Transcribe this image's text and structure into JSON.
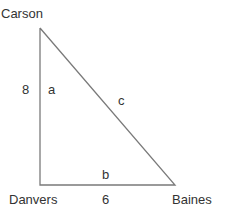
{
  "diagram": {
    "type": "right-triangle",
    "stroke_color": "#7a7a7a",
    "text_color": "#333333",
    "vertices": [
      {
        "name": "Carson",
        "x": 40,
        "y": 28
      },
      {
        "name": "Danvers",
        "x": 40,
        "y": 185
      },
      {
        "name": "Baines",
        "x": 175,
        "y": 185
      }
    ],
    "vertex_labels": {
      "carson": "Carson",
      "danvers": "Danvers",
      "baines": "Baines"
    },
    "sides": {
      "a": {
        "label": "a",
        "length": "8"
      },
      "b": {
        "label": "b",
        "length": "6"
      },
      "c": {
        "label": "c"
      }
    }
  }
}
